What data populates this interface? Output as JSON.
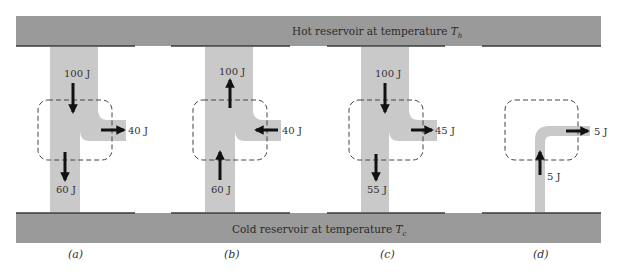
{
  "colors": {
    "reservoir": "#9a9a9a",
    "reservoir_edge": "#3a3a3a",
    "pipe": "#c9c9c9",
    "arrow": "#111111",
    "dashed_box": "#444444"
  },
  "hot_reservoir": {
    "label": "Hot reservoir at temperature ",
    "symbol": "T",
    "subscript": "h"
  },
  "cold_reservoir": {
    "label": "Cold reservoir at temperature ",
    "symbol": "T",
    "subscript": "c"
  },
  "engines": [
    {
      "caption": "(a)",
      "top_flow": {
        "value": "100 J",
        "direction": "down"
      },
      "side_flow": {
        "value": "40 J",
        "direction": "right"
      },
      "bottom_flow": {
        "value": "60 J",
        "direction": "down"
      }
    },
    {
      "caption": "(b)",
      "top_flow": {
        "value": "100 J",
        "direction": "up"
      },
      "side_flow": {
        "value": "40 J",
        "direction": "left"
      },
      "bottom_flow": {
        "value": "60 J",
        "direction": "up"
      }
    },
    {
      "caption": "(c)",
      "top_flow": {
        "value": "100 J",
        "direction": "down"
      },
      "side_flow": {
        "value": "45 J",
        "direction": "right"
      },
      "bottom_flow": {
        "value": "55 J",
        "direction": "down"
      }
    },
    {
      "caption": "(d)",
      "side_flow": {
        "value": "5 J",
        "direction": "right"
      },
      "bottom_flow": {
        "value": "5 J",
        "direction": "up"
      }
    }
  ]
}
